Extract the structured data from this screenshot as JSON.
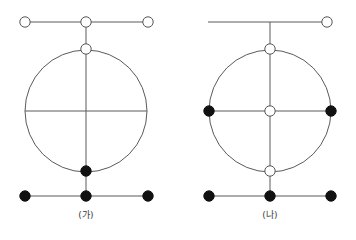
{
  "figure": {
    "title": "",
    "background_color": "#ffffff",
    "stroke_color": "#5a5a5a",
    "node_open_fill": "#ffffff",
    "node_open_stroke": "#555555",
    "node_filled_fill": "#111111",
    "node_filled_stroke": "#111111",
    "stroke_width": 1,
    "node_radius": 5.2
  },
  "diagrams": [
    {
      "id": "ga",
      "caption": "(가)",
      "center_x": 86,
      "ring": {
        "cx": 86,
        "cy": 111,
        "rx": 61,
        "ry": 61,
        "shape": "circle",
        "vertical_diameter": true,
        "horizontal_diameter": true
      },
      "top_bar": {
        "y": 22,
        "x1": 25,
        "x2": 148
      },
      "bottom_bar": {
        "y": 196,
        "x1": 25,
        "x2": 148
      },
      "connectors": [
        {
          "name": "top-bar-to-ring-top",
          "x": 86,
          "y1": 22,
          "y2": 49
        },
        {
          "name": "ring-bottom-to-bottom-bar",
          "x": 86,
          "y1": 171,
          "y2": 196
        }
      ],
      "nodes": [
        {
          "name": "top-bar-left",
          "x": 25,
          "y": 22,
          "type": "open"
        },
        {
          "name": "top-bar-center",
          "x": 86,
          "y": 22,
          "type": "open"
        },
        {
          "name": "top-bar-right",
          "x": 148,
          "y": 22,
          "type": "open"
        },
        {
          "name": "ring-top",
          "x": 86,
          "y": 49,
          "type": "open"
        },
        {
          "name": "ring-bottom",
          "x": 86,
          "y": 171,
          "type": "filled"
        },
        {
          "name": "bottom-bar-left",
          "x": 25,
          "y": 196,
          "type": "filled"
        },
        {
          "name": "bottom-bar-center",
          "x": 86,
          "y": 196,
          "type": "filled"
        },
        {
          "name": "bottom-bar-right",
          "x": 148,
          "y": 196,
          "type": "filled"
        }
      ]
    },
    {
      "id": "na",
      "caption": "(나)",
      "center_x": 270,
      "ring": {
        "cx": 270,
        "cy": 111,
        "rx": 61,
        "ry": 61,
        "shape": "circle",
        "vertical_diameter": true,
        "horizontal_diameter": true
      },
      "top_bar": {
        "y": 22,
        "x1": 208,
        "x2": 327
      },
      "bottom_bar": {
        "y": 196,
        "x1": 209,
        "x2": 331
      },
      "connectors": [
        {
          "name": "top-bar-to-ring-top",
          "x": 270,
          "y1": 22,
          "y2": 49
        },
        {
          "name": "ring-bottom-to-bottom-bar",
          "x": 270,
          "y1": 171,
          "y2": 196
        }
      ],
      "nodes": [
        {
          "name": "top-bar-right",
          "x": 327,
          "y": 22,
          "type": "open"
        },
        {
          "name": "ring-top",
          "x": 270,
          "y": 49,
          "type": "open"
        },
        {
          "name": "ring-left",
          "x": 209,
          "y": 111,
          "type": "filled"
        },
        {
          "name": "ring-center",
          "x": 270,
          "y": 111,
          "type": "open"
        },
        {
          "name": "ring-right",
          "x": 331,
          "y": 111,
          "type": "filled"
        },
        {
          "name": "ring-bottom",
          "x": 270,
          "y": 171,
          "type": "open"
        },
        {
          "name": "bottom-bar-left",
          "x": 209,
          "y": 196,
          "type": "filled"
        },
        {
          "name": "bottom-bar-center",
          "x": 270,
          "y": 196,
          "type": "filled"
        },
        {
          "name": "bottom-bar-right",
          "x": 331,
          "y": 196,
          "type": "filled"
        }
      ]
    }
  ]
}
